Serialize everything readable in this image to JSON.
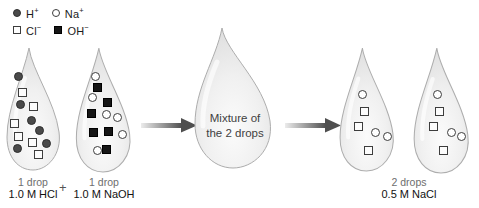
{
  "legend": {
    "items": [
      {
        "symbol": "filled-circle",
        "base": "H",
        "sup": "+"
      },
      {
        "symbol": "open-circle",
        "base": "Na",
        "sup": "+"
      },
      {
        "symbol": "open-square",
        "base": "Cl",
        "sup": "−"
      },
      {
        "symbol": "filled-square",
        "base": "OH",
        "sup": "−"
      }
    ]
  },
  "colors": {
    "h_plus": "#4a4a4a",
    "na_plus_stroke": "#3d3d3d",
    "cl_minus_stroke": "#3d3d3d",
    "oh_minus": "#161616",
    "arrow": "#4f4f4f",
    "drop_fill": "#eeeeee",
    "drop_stroke": "#adadad"
  },
  "mixture_drop": {
    "label_line1": "Mixture of",
    "label_line2": "the 2 drops"
  },
  "labels": {
    "hcl_line1": "1 drop",
    "hcl_line2": "1.0 M HCl",
    "plus": "+",
    "naoh_line1": "1 drop",
    "naoh_line2": "1.0 M NaOH",
    "nacl_line1": "2 drops",
    "nacl_line2": "0.5 M NaCl"
  },
  "drops": [
    {
      "id": "hcl-drop",
      "ions": [
        {
          "name": "h-plus",
          "type": "filled-circle",
          "x": 18,
          "y": 76
        },
        {
          "name": "h-plus",
          "type": "filled-circle",
          "x": 20,
          "y": 104
        },
        {
          "name": "h-plus",
          "type": "filled-circle",
          "x": 31,
          "y": 120
        },
        {
          "name": "h-plus",
          "type": "filled-circle",
          "x": 39,
          "y": 130
        },
        {
          "name": "h-plus",
          "type": "filled-circle",
          "x": 46,
          "y": 143
        },
        {
          "name": "h-plus",
          "type": "filled-circle",
          "x": 17,
          "y": 148
        },
        {
          "name": "cl-minus",
          "type": "open-square",
          "x": 22,
          "y": 92
        },
        {
          "name": "cl-minus",
          "type": "open-square",
          "x": 33,
          "y": 106
        },
        {
          "name": "cl-minus",
          "type": "open-square",
          "x": 14,
          "y": 123
        },
        {
          "name": "cl-minus",
          "type": "open-square",
          "x": 18,
          "y": 136
        },
        {
          "name": "cl-minus",
          "type": "open-square",
          "x": 32,
          "y": 142
        },
        {
          "name": "cl-minus",
          "type": "open-square",
          "x": 38,
          "y": 154
        }
      ]
    },
    {
      "id": "naoh-drop",
      "ions": [
        {
          "name": "na-plus",
          "type": "open-circle",
          "x": 95,
          "y": 76
        },
        {
          "name": "na-plus",
          "type": "open-circle",
          "x": 92,
          "y": 97
        },
        {
          "name": "na-plus",
          "type": "open-circle",
          "x": 106,
          "y": 114
        },
        {
          "name": "na-plus",
          "type": "open-circle",
          "x": 117,
          "y": 117
        },
        {
          "name": "na-plus",
          "type": "open-circle",
          "x": 122,
          "y": 134
        },
        {
          "name": "na-plus",
          "type": "open-circle",
          "x": 97,
          "y": 150
        },
        {
          "name": "oh-minus",
          "type": "filled-square",
          "x": 97,
          "y": 87
        },
        {
          "name": "oh-minus",
          "type": "filled-square",
          "x": 107,
          "y": 102
        },
        {
          "name": "oh-minus",
          "type": "filled-square",
          "x": 91,
          "y": 113
        },
        {
          "name": "oh-minus",
          "type": "filled-square",
          "x": 93,
          "y": 132
        },
        {
          "name": "oh-minus",
          "type": "filled-square",
          "x": 108,
          "y": 131
        },
        {
          "name": "oh-minus",
          "type": "filled-square",
          "x": 106,
          "y": 149
        }
      ]
    },
    {
      "id": "nacl-drop-1",
      "ions": [
        {
          "name": "na-plus",
          "type": "open-circle",
          "x": 362,
          "y": 94
        },
        {
          "name": "na-plus",
          "type": "open-circle",
          "x": 375,
          "y": 132
        },
        {
          "name": "na-plus",
          "type": "open-circle",
          "x": 387,
          "y": 136
        },
        {
          "name": "cl-minus",
          "type": "open-square",
          "x": 364,
          "y": 111
        },
        {
          "name": "cl-minus",
          "type": "open-square",
          "x": 358,
          "y": 126
        },
        {
          "name": "cl-minus",
          "type": "open-square",
          "x": 368,
          "y": 150
        }
      ]
    },
    {
      "id": "nacl-drop-2",
      "ions": [
        {
          "name": "na-plus",
          "type": "open-circle",
          "x": 437,
          "y": 94
        },
        {
          "name": "na-plus",
          "type": "open-circle",
          "x": 451,
          "y": 132
        },
        {
          "name": "na-plus",
          "type": "open-circle",
          "x": 461,
          "y": 136
        },
        {
          "name": "cl-minus",
          "type": "open-square",
          "x": 439,
          "y": 111
        },
        {
          "name": "cl-minus",
          "type": "open-square",
          "x": 433,
          "y": 126
        },
        {
          "name": "cl-minus",
          "type": "open-square",
          "x": 443,
          "y": 150
        }
      ]
    }
  ]
}
